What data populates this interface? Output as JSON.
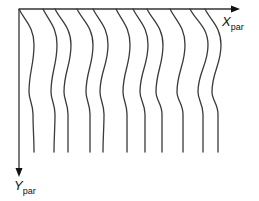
{
  "figure": {
    "type": "coordinate-diagram",
    "colors": {
      "background": "#ffffff",
      "axis": "#333333",
      "curves": "#3a3a3a",
      "text": "#111111"
    }
  },
  "axes": {
    "x": {
      "label_main": "X",
      "label_sub": "par",
      "direction": "right"
    },
    "y": {
      "label_main": "Y",
      "label_sub": "par",
      "direction": "down"
    }
  },
  "curves": [
    {
      "id": 1,
      "x_top": 19,
      "x_bulge": 34,
      "x_inward": 29,
      "x_lower": 33,
      "x_bottom": 34
    },
    {
      "id": 2,
      "x_top": 43,
      "x_bulge": 57,
      "x_inward": 51,
      "x_lower": 55,
      "x_bottom": 54
    },
    {
      "id": 3,
      "x_top": 55,
      "x_bulge": 71,
      "x_inward": 64,
      "x_lower": 68,
      "x_bottom": 68
    },
    {
      "id": 4,
      "x_top": 77,
      "x_bulge": 93,
      "x_inward": 86,
      "x_lower": 90,
      "x_bottom": 90
    },
    {
      "id": 5,
      "x_top": 93,
      "x_bulge": 108,
      "x_inward": 100,
      "x_lower": 104,
      "x_bottom": 103
    },
    {
      "id": 6,
      "x_top": 116,
      "x_bulge": 130,
      "x_inward": 123,
      "x_lower": 127,
      "x_bottom": 127
    },
    {
      "id": 7,
      "x_top": 133,
      "x_bulge": 148,
      "x_inward": 140,
      "x_lower": 145,
      "x_bottom": 145
    },
    {
      "id": 8,
      "x_top": 147,
      "x_bulge": 163,
      "x_inward": 156,
      "x_lower": 162,
      "x_bottom": 162
    },
    {
      "id": 9,
      "x_top": 170,
      "x_bulge": 185,
      "x_inward": 177,
      "x_lower": 183,
      "x_bottom": 183
    },
    {
      "id": 10,
      "x_top": 190,
      "x_bulge": 208,
      "x_inward": 198,
      "x_lower": 203,
      "x_bottom": 203
    },
    {
      "id": 11,
      "x_top": 205,
      "x_bulge": 221,
      "x_inward": 212,
      "x_lower": 218,
      "x_bottom": 218
    }
  ]
}
